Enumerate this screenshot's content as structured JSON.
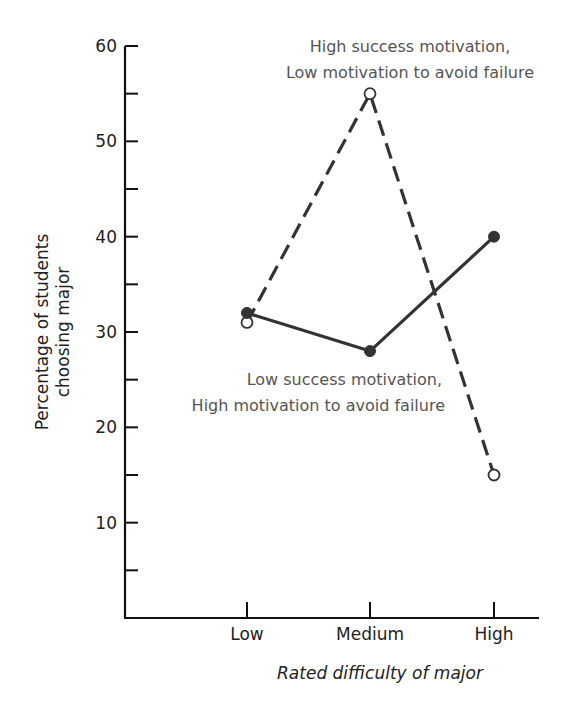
{
  "chart_data": {
    "type": "line",
    "title": "",
    "xlabel": "Rated difficulty of major",
    "ylabel": "Percentage of students choosing major",
    "ylabel_lines": [
      "Percentage of students",
      "choosing major"
    ],
    "categories": [
      "Low",
      "Medium",
      "High"
    ],
    "ylim": [
      0,
      60
    ],
    "yticks_major": [
      10,
      20,
      30,
      40,
      50,
      60
    ],
    "yticks_minor": [
      5,
      15,
      25,
      35,
      45,
      55
    ],
    "grid": false,
    "legend": "inline annotations",
    "series": [
      {
        "name": "High success motivation, Low motivation to avoid failure",
        "label_lines": [
          "High success motivation,",
          "Low motivation to avoid failure"
        ],
        "style": "dashed",
        "marker": "open-circle",
        "values": [
          31,
          55,
          15
        ]
      },
      {
        "name": "Low success motivation, High motivation to avoid failure",
        "label_lines": [
          "Low success motivation,",
          "High motivation to avoid failure"
        ],
        "style": "solid",
        "marker": "filled-circle",
        "values": [
          32,
          28,
          40
        ]
      }
    ]
  },
  "colors": {
    "axis": "#111111",
    "line": "#333333",
    "annotation_text": "#555555"
  }
}
